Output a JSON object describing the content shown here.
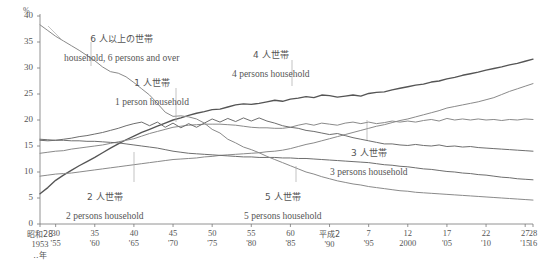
{
  "chart_data": {
    "type": "line",
    "title": "",
    "xlabel": "年",
    "ylabel": "%",
    "yunit": "%",
    "ylim": [
      0,
      40
    ],
    "yticks": [
      0,
      5,
      10,
      15,
      20,
      25,
      30,
      35,
      40
    ],
    "grid": false,
    "legend_position": "inline-annotations",
    "x": [
      1953,
      1954,
      1955,
      1956,
      1957,
      1958,
      1959,
      1960,
      1961,
      1962,
      1963,
      1964,
      1965,
      1966,
      1967,
      1968,
      1969,
      1970,
      1971,
      1972,
      1973,
      1974,
      1975,
      1976,
      1977,
      1978,
      1979,
      1980,
      1981,
      1982,
      1983,
      1984,
      1985,
      1986,
      1987,
      1988,
      1989,
      1990,
      1991,
      1992,
      1993,
      1994,
      1995,
      1996,
      1997,
      1998,
      1999,
      2000,
      2001,
      2002,
      2003,
      2004,
      2005,
      2006,
      2007,
      2008,
      2009,
      2010,
      2011,
      2012,
      2013,
      2014,
      2015,
      2016
    ],
    "xlim": [
      1953,
      2016
    ],
    "series": [
      {
        "name": "1 person household",
        "name_jp": "1 人世帯",
        "color": "#555555",
        "values": [
          5.8,
          7.0,
          8.4,
          9.4,
          10.3,
          11.2,
          12.0,
          12.8,
          13.7,
          14.6,
          15.4,
          16.2,
          16.9,
          17.6,
          18.2,
          18.8,
          19.4,
          20.0,
          20.4,
          20.9,
          21.3,
          21.6,
          22.0,
          22.1,
          22.5,
          22.9,
          23.1,
          23.0,
          23.2,
          23.5,
          23.8,
          23.6,
          24.0,
          24.2,
          24.5,
          24.3,
          24.8,
          24.7,
          24.4,
          24.6,
          24.8,
          24.6,
          25.1,
          25.3,
          25.4,
          25.8,
          26.1,
          26.4,
          26.7,
          26.9,
          27.3,
          27.5,
          27.9,
          28.2,
          28.6,
          28.9,
          29.2,
          29.6,
          29.9,
          30.2,
          30.6,
          30.9,
          31.3,
          31.7
        ]
      },
      {
        "name": "2 persons household",
        "name_jp": "2 人世帯",
        "color": "#8a8a8a",
        "values": [
          9.2,
          9.4,
          9.6,
          9.7,
          9.8,
          10.0,
          10.2,
          10.4,
          10.6,
          10.8,
          11.0,
          11.2,
          11.4,
          11.6,
          11.8,
          12.0,
          12.2,
          12.4,
          12.5,
          12.6,
          12.7,
          12.9,
          13.0,
          13.2,
          13.3,
          13.4,
          13.5,
          13.6,
          13.7,
          13.9,
          14.0,
          14.2,
          14.5,
          14.9,
          15.3,
          15.6,
          16.0,
          16.4,
          16.8,
          17.2,
          17.6,
          18.0,
          18.4,
          18.8,
          19.1,
          19.5,
          19.9,
          20.2,
          20.6,
          21.0,
          21.4,
          21.8,
          22.3,
          22.6,
          22.9,
          23.2,
          23.5,
          23.9,
          24.3,
          24.9,
          25.5,
          26.0,
          26.5,
          27.0
        ]
      },
      {
        "name": "3 persons household",
        "name_jp": "3 人世帯",
        "color": "#8a8a8a",
        "values": [
          13.6,
          13.8,
          14.0,
          14.1,
          14.4,
          14.6,
          14.8,
          15.0,
          15.2,
          15.5,
          15.8,
          16.1,
          16.4,
          16.9,
          17.4,
          17.8,
          18.2,
          18.6,
          18.8,
          19.0,
          19.1,
          19.2,
          19.2,
          19.2,
          19.1,
          19.0,
          18.8,
          18.6,
          18.5,
          18.5,
          18.4,
          18.4,
          18.6,
          19.0,
          19.3,
          19.0,
          19.4,
          19.2,
          19.0,
          19.4,
          19.6,
          19.3,
          19.6,
          19.3,
          19.5,
          19.8,
          19.6,
          19.8,
          19.6,
          19.9,
          20.1,
          19.8,
          20.3,
          20.0,
          20.2,
          20.0,
          20.2,
          20.0,
          20.1,
          19.9,
          20.1,
          20.0,
          20.2,
          20.1
        ]
      },
      {
        "name": "4 persons household",
        "name_jp": "4 人世帯",
        "color": "#6e6e6e",
        "values": [
          16.1,
          16.0,
          16.1,
          16.3,
          16.5,
          16.8,
          17.0,
          17.3,
          17.6,
          18.0,
          18.4,
          18.9,
          19.3,
          19.6,
          18.9,
          19.6,
          18.6,
          19.4,
          18.5,
          19.3,
          18.6,
          19.4,
          20.2,
          19.6,
          20.3,
          19.7,
          20.4,
          19.8,
          20.4,
          19.8,
          19.4,
          18.9,
          18.6,
          18.4,
          18.0,
          17.8,
          17.5,
          17.2,
          17.4,
          17.0,
          16.6,
          16.3,
          16.0,
          15.7,
          15.4,
          15.4,
          15.2,
          15.1,
          15.3,
          15.1,
          15.0,
          15.2,
          14.9,
          15.0,
          14.8,
          14.9,
          14.7,
          14.6,
          14.5,
          14.4,
          14.3,
          14.2,
          14.1,
          14.0
        ]
      },
      {
        "name": "5 persons household",
        "name_jp": "5 人世帯",
        "color": "#6e6e6e",
        "values": [
          16.3,
          16.2,
          16.1,
          16.1,
          16.0,
          16.0,
          15.9,
          15.9,
          15.8,
          15.7,
          15.6,
          15.4,
          15.2,
          15.0,
          14.8,
          14.6,
          14.3,
          14.0,
          13.8,
          13.6,
          13.5,
          13.4,
          13.3,
          13.2,
          13.1,
          13.0,
          12.9,
          12.9,
          12.8,
          12.8,
          12.8,
          12.7,
          12.7,
          12.6,
          12.6,
          12.5,
          12.4,
          12.3,
          12.2,
          12.1,
          12.0,
          11.9,
          11.8,
          11.6,
          11.4,
          11.3,
          11.1,
          11.0,
          10.8,
          10.6,
          10.5,
          10.3,
          10.1,
          10.0,
          9.8,
          9.7,
          9.5,
          9.4,
          9.2,
          9.0,
          8.9,
          8.7,
          8.6,
          8.5
        ]
      },
      {
        "name": "household, 6 persons and over",
        "name_jp": "6 人以上の世帯",
        "color": "#8a8a8a",
        "values": [
          38.3,
          37.2,
          36.1,
          35.2,
          34.3,
          33.4,
          32.4,
          31.4,
          30.2,
          29.3,
          29.0,
          28.3,
          27.2,
          26.0,
          24.8,
          23.2,
          21.5,
          20.7,
          20.8,
          20.6,
          20.2,
          19.4,
          18.2,
          17.5,
          16.3,
          15.6,
          14.8,
          14.3,
          13.7,
          13.0,
          12.4,
          11.8,
          11.2,
          10.6,
          10.0,
          9.6,
          9.1,
          8.7,
          8.3,
          8.0,
          7.7,
          7.5,
          7.2,
          7.0,
          6.8,
          6.6,
          6.4,
          6.3,
          6.1,
          6.0,
          5.9,
          5.8,
          5.7,
          5.6,
          5.5,
          5.4,
          5.3,
          5.2,
          5.1,
          5.0,
          4.9,
          4.8,
          4.7,
          4.6
        ]
      }
    ],
    "annotations": [
      {
        "id": "a6",
        "jp": "6 人以上の世帯",
        "en": "household, 6 persons and over"
      },
      {
        "id": "a1",
        "jp": "1 人世帯",
        "en": "1 person household"
      },
      {
        "id": "a4",
        "jp": "4 人世帯",
        "en": "4 persons household"
      },
      {
        "id": "a3",
        "jp": "3 人世帯",
        "en": "3 persons household"
      },
      {
        "id": "a2",
        "jp": "2 人世帯",
        "en": "2 persons household"
      },
      {
        "id": "a5",
        "jp": "5 人世帯",
        "en": "5 persons household"
      }
    ],
    "xticks": [
      {
        "era": "昭和28",
        "west": "1953",
        "note": "‥年",
        "jp": true
      },
      {
        "era": "30",
        "west": "'55",
        "note": "",
        "jp": false
      },
      {
        "era": "35",
        "west": "'60",
        "note": "",
        "jp": false
      },
      {
        "era": "40",
        "west": "'65",
        "note": "",
        "jp": false
      },
      {
        "era": "45",
        "west": "'70",
        "note": "",
        "jp": false
      },
      {
        "era": "50",
        "west": "'75",
        "note": "",
        "jp": false
      },
      {
        "era": "55",
        "west": "'80",
        "note": "",
        "jp": false
      },
      {
        "era": "60",
        "west": "'85",
        "note": "",
        "jp": false
      },
      {
        "era": "平成2",
        "west": "'90",
        "note": "",
        "jp": true
      },
      {
        "era": "7",
        "west": "'95",
        "note": "",
        "jp": false
      },
      {
        "era": "12",
        "west": "2000",
        "note": "",
        "jp": false
      },
      {
        "era": "17",
        "west": "'05",
        "note": "",
        "jp": false
      },
      {
        "era": "22",
        "west": "'10",
        "note": "",
        "jp": false
      },
      {
        "era": "27",
        "west": "'15",
        "note": "",
        "jp": false
      },
      {
        "era": "28",
        "west": "16",
        "note": "",
        "jp": false
      }
    ]
  },
  "axis": {
    "yunit": "%",
    "y_labels": [
      "40",
      "35",
      "30",
      "25",
      "20",
      "15",
      "10",
      "5",
      "0"
    ]
  },
  "footnote": {
    "text": ""
  }
}
